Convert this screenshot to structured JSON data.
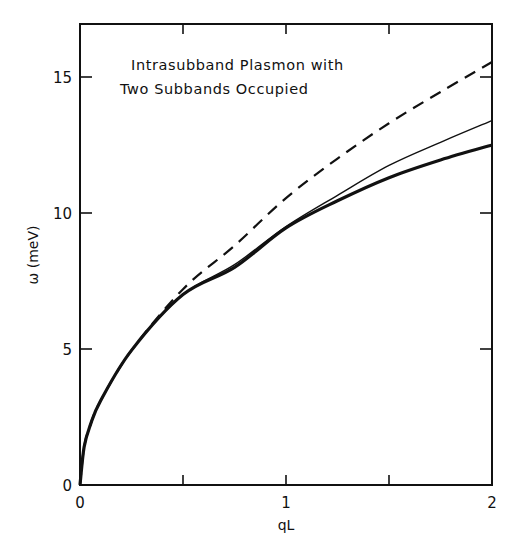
{
  "chart_data": {
    "type": "line",
    "title": "Intrasubband Plasmon with Two Subbands Occupied",
    "title_lines": [
      "Intrasubband Plasmon with",
      "Two Subbands Occupied"
    ],
    "xlabel": "qL",
    "ylabel": "ω (meV)",
    "xlim": [
      0,
      2
    ],
    "ylim": [
      0,
      16.9
    ],
    "grid": false,
    "legend": null,
    "x_ticks": [
      0,
      0.5,
      1,
      1.5,
      2
    ],
    "x_tick_labels": [
      "0",
      "",
      "1",
      "",
      "2"
    ],
    "y_ticks": [
      0,
      5,
      10,
      15
    ],
    "y_tick_labels": [
      "0",
      "5",
      "10",
      "15"
    ],
    "x": [
      0,
      0.02,
      0.05,
      0.1,
      0.25,
      0.5,
      0.75,
      1.0,
      1.25,
      1.5,
      1.75,
      2.0
    ],
    "series": [
      {
        "name": "dashed",
        "style": "dashed",
        "width": 2.2,
        "values": [
          0,
          1.4,
          2.2,
          3.1,
          4.95,
          7.2,
          8.8,
          10.55,
          12.0,
          13.3,
          14.45,
          15.55
        ]
      },
      {
        "name": "thin-solid",
        "style": "solid",
        "width": 1.4,
        "values": [
          0,
          1.4,
          2.2,
          3.1,
          4.95,
          7.0,
          8.1,
          9.5,
          10.65,
          11.75,
          12.6,
          13.4
        ]
      },
      {
        "name": "thick-solid",
        "style": "solid",
        "width": 3.2,
        "values": [
          0,
          1.4,
          2.2,
          3.1,
          4.95,
          7.0,
          8.0,
          9.45,
          10.45,
          11.3,
          11.95,
          12.5
        ]
      }
    ]
  }
}
